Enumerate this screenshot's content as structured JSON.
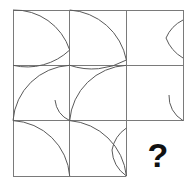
{
  "puzzle": {
    "type": "matrix-reasoning",
    "rows": 3,
    "columns": 3,
    "missing_cell_label": "?",
    "missing_cell_position": "row3-col3",
    "colors": {
      "background": "#ffffff",
      "grid_line": "#7a7a7a",
      "arc_line": "#5a5a5a",
      "question_mark": "#111111"
    },
    "geometry": {
      "grid_left": 13,
      "grid_top": 10,
      "cell_width": 56.7,
      "cell_height": 55.3
    },
    "cells": [
      {
        "id": "cell-r1c1",
        "row": 1,
        "col": 1,
        "arcs": [
          {
            "name": "arc-tl-to-right",
            "corner": "top-left",
            "sweep": 1,
            "from": "top-left",
            "to": "right-mid"
          },
          {
            "name": "arc-bl-to-right",
            "corner": "bottom-left",
            "sweep": 0,
            "from": "bottom-left",
            "to": "right-mid"
          }
        ]
      },
      {
        "id": "cell-r1c2",
        "row": 1,
        "col": 2,
        "arcs": [
          {
            "name": "arc-tl-to-rightlow",
            "corner": "top-left",
            "sweep": 1,
            "from": "top-left",
            "to": "right-lower"
          },
          {
            "name": "arc-bl-to-rightlow",
            "corner": "bottom-left",
            "sweep": 0,
            "from": "bottom-left",
            "to": "right-lower"
          }
        ]
      },
      {
        "id": "cell-r1c3",
        "row": 1,
        "col": 3,
        "arcs": [
          {
            "name": "arc-topright-inward",
            "corner": "top-right",
            "sweep": 1,
            "from": "right-upper",
            "to": "mid-point"
          },
          {
            "name": "arc-bottomright-inward",
            "corner": "bottom-right",
            "sweep": 0,
            "from": "right-lower",
            "to": "mid-point"
          }
        ]
      },
      {
        "id": "cell-r2c1",
        "row": 2,
        "col": 1,
        "arcs": [
          {
            "name": "arc-tr-to-bl",
            "corner": "top-right",
            "sweep": 0,
            "from": "top-right",
            "to": "bottom-left"
          },
          {
            "name": "arc-small-to-br",
            "corner": "bottom-right",
            "sweep": 0,
            "from": "mid-point",
            "to": "bottom-right"
          }
        ]
      },
      {
        "id": "cell-r2c2",
        "row": 2,
        "col": 2,
        "arcs": [
          {
            "name": "arc-tr-to-bl",
            "corner": "top-right",
            "sweep": 0,
            "from": "top-right",
            "to": "bottom-left"
          }
        ]
      },
      {
        "id": "cell-r2c3",
        "row": 2,
        "col": 3,
        "arcs": [
          {
            "name": "arc-small-bottom-right",
            "corner": "bottom-right",
            "sweep": 0,
            "from": "inner-point",
            "to": "bottom-right"
          }
        ]
      },
      {
        "id": "cell-r3c1",
        "row": 3,
        "col": 1,
        "arcs": [
          {
            "name": "arc-tl-to-br",
            "corner": "top-left",
            "sweep": 1,
            "from": "top-left",
            "to": "bottom-right"
          }
        ]
      },
      {
        "id": "cell-r3c2",
        "row": 3,
        "col": 2,
        "arcs": [
          {
            "name": "arc-tl-to-br",
            "corner": "top-left",
            "sweep": 1,
            "from": "top-left",
            "to": "bottom-right"
          },
          {
            "name": "arc-tr-to-br",
            "corner": "top-right",
            "sweep": 0,
            "from": "top-right",
            "to": "bottom-right"
          }
        ]
      },
      {
        "id": "cell-r3c3",
        "row": 3,
        "col": 3,
        "arcs": [],
        "is_missing": true
      }
    ]
  }
}
